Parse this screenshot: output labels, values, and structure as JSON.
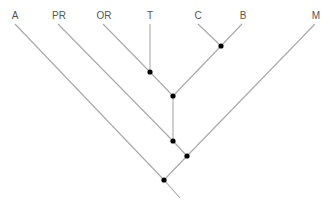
{
  "diagram": {
    "type": "cladogram",
    "taxa": [
      {
        "id": "A",
        "label": "A",
        "x": 15,
        "y": 12
      },
      {
        "id": "PR",
        "label": "PR",
        "x": 58,
        "y": 12
      },
      {
        "id": "OR",
        "label": "OR",
        "x": 103,
        "y": 12
      },
      {
        "id": "T",
        "label": "T",
        "x": 150,
        "y": 12
      },
      {
        "id": "C",
        "label": "C",
        "x": 198,
        "y": 12
      },
      {
        "id": "B",
        "label": "B",
        "x": 242,
        "y": 12
      },
      {
        "id": "M",
        "label": "M",
        "x": 315,
        "y": 12
      }
    ],
    "nodes": [
      {
        "id": "n_CB",
        "x": 221,
        "y": 46,
        "children": [
          "C",
          "B"
        ]
      },
      {
        "id": "n_OR_T",
        "x": 150,
        "y": 72,
        "children": [
          "OR",
          "T"
        ]
      },
      {
        "id": "n_ORT_CB",
        "x": 173,
        "y": 96,
        "children": [
          "n_OR_T",
          "n_CB"
        ]
      },
      {
        "id": "n_PR",
        "x": 173,
        "y": 141,
        "children": [
          "PR",
          "n_ORT_CB"
        ]
      },
      {
        "id": "n_M",
        "x": 187,
        "y": 156,
        "children": [
          "n_PR",
          "M"
        ]
      },
      {
        "id": "root",
        "x": 164,
        "y": 180,
        "children": [
          "A",
          "n_M"
        ]
      }
    ],
    "colors": {
      "edge": "#a8a8a8",
      "node": "#000000",
      "label": "#555555"
    }
  }
}
